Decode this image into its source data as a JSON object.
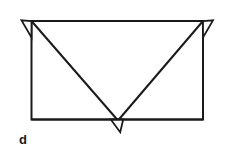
{
  "figure": {
    "label": "d",
    "caption_text": "d",
    "kind": "line-diagram",
    "stroke_color": "#1a1a1a",
    "fill_color": "#ffffff",
    "background_color": "#ffffff",
    "stroke_width": 2,
    "thin_stroke_width": 1.6,
    "canvas": {
      "width": 225,
      "height": 166
    },
    "geometry": {
      "rectangle": {
        "left": 31.5,
        "top": 21,
        "right": 203,
        "bottom": 119.5
      },
      "apex": {
        "x": 118,
        "y": 120.5
      },
      "diagonals": [
        {
          "name": "left-diagonal",
          "from": [
            31.5,
            21
          ],
          "to": [
            118,
            120.5
          ]
        },
        {
          "name": "right-diagonal",
          "from": [
            203,
            21
          ],
          "to": [
            118,
            120.5
          ]
        }
      ],
      "flaps": [
        {
          "name": "top-left-flap",
          "points": [
            [
              31.5,
              21
            ],
            [
              21.5,
              20.5
            ],
            [
              31.5,
              37
            ]
          ]
        },
        {
          "name": "top-right-flap",
          "points": [
            [
              203,
              21
            ],
            [
              213,
              20.5
            ],
            [
              203,
              37
            ]
          ]
        },
        {
          "name": "bottom-center-flap",
          "points": [
            [
              110.5,
              119.5
            ],
            [
              123,
              119.5
            ],
            [
              120,
              132
            ]
          ]
        }
      ]
    }
  }
}
